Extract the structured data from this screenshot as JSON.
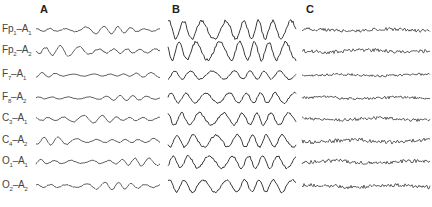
{
  "figure": {
    "panels": [
      {
        "id": "A",
        "label": "A",
        "x": 40,
        "x_start": 36,
        "x_end": 160,
        "amplitude_profile": [
          3,
          4,
          2,
          2,
          3,
          3,
          3,
          3
        ],
        "freq": 0.18
      },
      {
        "id": "B",
        "label": "B",
        "x": 172,
        "x_start": 168,
        "x_end": 296,
        "amplitude_profile": [
          9,
          9,
          4,
          5,
          6,
          6,
          6,
          6
        ],
        "freq": 0.16
      },
      {
        "id": "C",
        "label": "C",
        "x": 306,
        "x_start": 302,
        "x_end": 430,
        "amplitude_profile": [
          1.6,
          1.8,
          1.2,
          1.4,
          1.6,
          2,
          1.8,
          1.8
        ],
        "freq": 0.9
      }
    ],
    "channels": [
      {
        "name": "Fp1–A1",
        "main": "Fp",
        "sub1": "1",
        "ref": "A",
        "sub2": "1",
        "y": 30
      },
      {
        "name": "Fp2–A2",
        "main": "Fp",
        "sub1": "2",
        "ref": "A",
        "sub2": "2",
        "y": 51
      },
      {
        "name": "F7–A1",
        "main": "F",
        "sub1": "7",
        "ref": "A",
        "sub2": "1",
        "y": 75
      },
      {
        "name": "F8–A2",
        "main": "F",
        "sub1": "8",
        "ref": "A",
        "sub2": "2",
        "y": 98
      },
      {
        "name": "C3–A1",
        "main": "C",
        "sub1": "3",
        "ref": "A",
        "sub2": "1",
        "y": 119
      },
      {
        "name": "C4–A2",
        "main": "C",
        "sub1": "4",
        "ref": "A",
        "sub2": "2",
        "y": 141
      },
      {
        "name": "O1–A1",
        "main": "O",
        "sub1": "1",
        "ref": "A",
        "sub2": "1",
        "y": 162
      },
      {
        "name": "O2–A2",
        "main": "O",
        "sub1": "2",
        "ref": "A",
        "sub2": "2",
        "y": 186
      }
    ],
    "trace_color": "#3a3a3a"
  }
}
